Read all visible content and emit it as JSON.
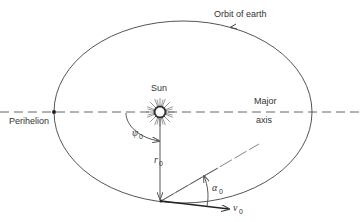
{
  "figure": {
    "labels": {
      "orbit": "Orbit of earth",
      "sun": "Sun",
      "perihelion": "Perihelion",
      "major_axis_line1": "Major",
      "major_axis_line2": "axis"
    },
    "symbols": {
      "psi": "ψ",
      "psi_sub": "0",
      "r": "r",
      "r_sub": "0",
      "alpha": "α",
      "alpha_sub": "0",
      "v": "v",
      "v_sub": "0"
    },
    "colors": {
      "line": "#555555",
      "text": "#333333",
      "background": "#ffffff"
    }
  }
}
